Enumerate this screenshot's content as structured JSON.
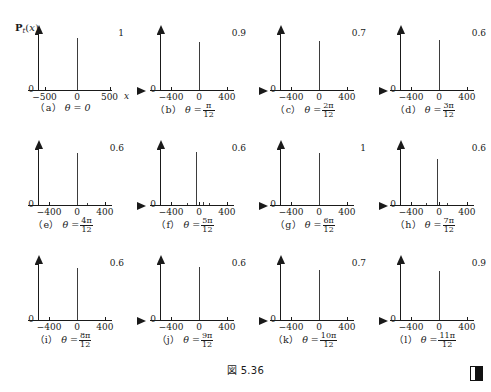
{
  "figure": {
    "caption": "図 5.36",
    "axis_quantity_label": "P_t(x)",
    "axis_quantity_parts": {
      "symbol": "P",
      "subscript": "t",
      "argument": "(x)"
    },
    "end_marker": "end-of-proof-square",
    "ink_color": "#1a1a1a",
    "spike_color": "#3d3d3d",
    "background": "#ffffff"
  },
  "chart_data": {
    "type": "line",
    "title": "図 5.36",
    "xlabel": "x",
    "ylabel": "P_t(x)",
    "grid": false,
    "legend": "none",
    "panels": [
      {
        "id": "a",
        "tag": "（a）",
        "theta_label": "θ = 0",
        "theta_numerator": "",
        "theta_denominator": "",
        "ylim": [
          0,
          1
        ],
        "ytop_label": "1",
        "yzero_label": "0",
        "xlim": [
          -600,
          600
        ],
        "xticks": [
          -500,
          0,
          500
        ],
        "xticklabels": [
          "−500",
          "0",
          "500"
        ],
        "xaxis_name": "x",
        "spikes": [
          {
            "x": 0,
            "y": 0.93
          }
        ]
      },
      {
        "id": "b",
        "tag": "（b）",
        "theta_label": "θ =",
        "theta_numerator": "π",
        "theta_denominator": "12",
        "ylim": [
          0,
          0.9
        ],
        "ytop_label": "0.9",
        "yzero_label": "0",
        "xlim": [
          -560,
          560
        ],
        "xticks": [
          -400,
          0,
          400
        ],
        "xticklabels": [
          "−400",
          "0",
          "400"
        ],
        "xaxis_name": "",
        "spikes": [
          {
            "x": 0,
            "y": 0.86
          }
        ]
      },
      {
        "id": "c",
        "tag": "（c）",
        "theta_label": "θ =",
        "theta_numerator": "2π",
        "theta_denominator": "12",
        "ylim": [
          0,
          0.7
        ],
        "ytop_label": "0.7",
        "yzero_label": "0",
        "xlim": [
          -560,
          560
        ],
        "xticks": [
          -400,
          0,
          400
        ],
        "xticklabels": [
          "−400",
          "0",
          "400"
        ],
        "xaxis_name": "",
        "spikes": [
          {
            "x": 0,
            "y": 0.88
          }
        ]
      },
      {
        "id": "d",
        "tag": "（d）",
        "theta_label": "θ =",
        "theta_numerator": "3π",
        "theta_denominator": "12",
        "ylim": [
          0,
          0.6
        ],
        "ytop_label": "0.6",
        "yzero_label": "0",
        "xlim": [
          -560,
          560
        ],
        "xticks": [
          -400,
          0,
          400
        ],
        "xticklabels": [
          "−400",
          "0",
          "400"
        ],
        "xaxis_name": "",
        "spikes": [
          {
            "x": 0,
            "y": 0.9
          }
        ]
      },
      {
        "id": "e",
        "tag": "（e）",
        "theta_label": "θ =",
        "theta_numerator": "4π",
        "theta_denominator": "12",
        "ylim": [
          0,
          0.6
        ],
        "ytop_label": "0.6",
        "yzero_label": "0",
        "xlim": [
          -560,
          560
        ],
        "xticks": [
          -400,
          0,
          400
        ],
        "xticklabels": [
          "−400",
          "0",
          "400"
        ],
        "xaxis_name": "",
        "spikes": [
          {
            "x": 0,
            "y": 0.93
          },
          {
            "x": 150,
            "y": 0.03
          }
        ]
      },
      {
        "id": "f",
        "tag": "（f）",
        "theta_label": "θ =",
        "theta_numerator": "5π",
        "theta_denominator": "12",
        "ylim": [
          0,
          0.6
        ],
        "ytop_label": "0.6",
        "yzero_label": "0",
        "xlim": [
          -560,
          560
        ],
        "xticks": [
          -400,
          0,
          400
        ],
        "xticklabels": [
          "−400",
          "0",
          "400"
        ],
        "xaxis_name": "",
        "spikes": [
          {
            "x": -40,
            "y": 0.95
          },
          {
            "x": 60,
            "y": 0.06
          },
          {
            "x": 140,
            "y": 0.04
          },
          {
            "x": -170,
            "y": 0.03
          }
        ]
      },
      {
        "id": "g",
        "tag": "（g）",
        "theta_label": "θ =",
        "theta_numerator": "6π",
        "theta_denominator": "12",
        "ylim": [
          0,
          1
        ],
        "ytop_label": "1",
        "yzero_label": "0",
        "xlim": [
          -560,
          560
        ],
        "xticks": [
          -400,
          0,
          400
        ],
        "xticklabels": [
          "−400",
          "0",
          "400"
        ],
        "xaxis_name": "",
        "spikes": [
          {
            "x": 0,
            "y": 0.93
          }
        ]
      },
      {
        "id": "h",
        "tag": "（h）",
        "theta_label": "θ =",
        "theta_numerator": "7π",
        "theta_denominator": "12",
        "ylim": [
          0,
          0.6
        ],
        "ytop_label": "0.6",
        "yzero_label": "0",
        "xlim": [
          -560,
          560
        ],
        "xticks": [
          -400,
          0,
          400
        ],
        "xticklabels": [
          "−400",
          "0",
          "400"
        ],
        "xaxis_name": "",
        "spikes": [
          {
            "x": -30,
            "y": 0.82
          },
          {
            "x": 110,
            "y": 0.04
          },
          {
            "x": -180,
            "y": 0.03
          }
        ]
      },
      {
        "id": "i",
        "tag": "（i）",
        "theta_label": "θ =",
        "theta_numerator": "8π",
        "theta_denominator": "12",
        "ylim": [
          0,
          0.6
        ],
        "ytop_label": "0.6",
        "yzero_label": "0",
        "xlim": [
          -560,
          560
        ],
        "xticks": [
          -400,
          0,
          400
        ],
        "xticklabels": [
          "−400",
          "0",
          "400"
        ],
        "xaxis_name": "",
        "spikes": [
          {
            "x": 0,
            "y": 0.93
          }
        ]
      },
      {
        "id": "j",
        "tag": "（j）",
        "theta_label": "θ =",
        "theta_numerator": "9π",
        "theta_denominator": "12",
        "ylim": [
          0,
          0.6
        ],
        "ytop_label": "0.6",
        "yzero_label": "0",
        "xlim": [
          -560,
          560
        ],
        "xticks": [
          -400,
          0,
          400
        ],
        "xticklabels": [
          "−400",
          "0",
          "400"
        ],
        "xaxis_name": "",
        "spikes": [
          {
            "x": 0,
            "y": 0.95
          }
        ]
      },
      {
        "id": "k",
        "tag": "（k）",
        "theta_label": "θ =",
        "theta_numerator": "10π",
        "theta_denominator": "12",
        "ylim": [
          0,
          0.7
        ],
        "ytop_label": "0.7",
        "yzero_label": "0",
        "xlim": [
          -560,
          560
        ],
        "xticks": [
          -400,
          0,
          400
        ],
        "xticklabels": [
          "−400",
          "0",
          "400"
        ],
        "xaxis_name": "",
        "spikes": [
          {
            "x": 0,
            "y": 0.9
          }
        ]
      },
      {
        "id": "l",
        "tag": "（l）",
        "theta_label": "θ =",
        "theta_numerator": "11π",
        "theta_denominator": "12",
        "ylim": [
          0,
          0.9
        ],
        "ytop_label": "0.9",
        "yzero_label": "0",
        "xlim": [
          -560,
          560
        ],
        "xticks": [
          -400,
          0,
          400
        ],
        "xticklabels": [
          "−400",
          "0",
          "400"
        ],
        "xaxis_name": "",
        "spikes": [
          {
            "x": 0,
            "y": 0.88
          }
        ]
      }
    ]
  }
}
